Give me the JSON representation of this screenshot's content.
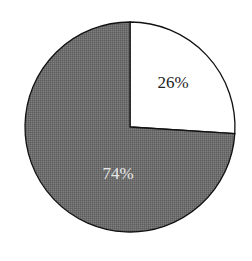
{
  "chart_data": {
    "type": "pie",
    "title": "",
    "categories": [
      "Slice A",
      "Slice B"
    ],
    "values": [
      26,
      74
    ],
    "labels": [
      "26%",
      "74%"
    ],
    "colors": [
      "#ffffff",
      "#6e6e6e"
    ],
    "label_colors": [
      "#222222",
      "#e8e8e8"
    ],
    "start_angle_deg": 0,
    "direction": "clockwise-from-top",
    "legend": false
  }
}
